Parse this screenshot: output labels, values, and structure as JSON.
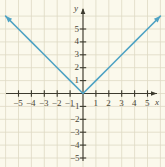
{
  "figure": {
    "name": "absolute-value-function-graph",
    "background_color": "#fbf9ec",
    "grid_color": "#ded9c4",
    "axis_color": "#3c3a2e",
    "curve_color": "#4fa3c4",
    "label_color": "#4a4636"
  },
  "axes": {
    "x_label": "x",
    "y_label": "y",
    "x_ticks": [
      {
        "value": -5,
        "label": "−5"
      },
      {
        "value": -4,
        "label": "−4"
      },
      {
        "value": -3,
        "label": "−3"
      },
      {
        "value": -2,
        "label": "−2"
      },
      {
        "value": -1,
        "label": "−1"
      },
      {
        "value": 1,
        "label": "1"
      },
      {
        "value": 2,
        "label": "2"
      },
      {
        "value": 3,
        "label": "3"
      },
      {
        "value": 4,
        "label": "4"
      },
      {
        "value": 5,
        "label": "5"
      }
    ],
    "y_ticks": [
      {
        "value": 5,
        "label": "5"
      },
      {
        "value": 4,
        "label": "4"
      },
      {
        "value": 3,
        "label": "3"
      },
      {
        "value": 2,
        "label": "2"
      },
      {
        "value": 1,
        "label": "1"
      },
      {
        "value": -1,
        "label": "−1"
      },
      {
        "value": -2,
        "label": "−2"
      },
      {
        "value": -3,
        "label": "−3"
      },
      {
        "value": -4,
        "label": "−4"
      },
      {
        "value": -5,
        "label": "−5"
      }
    ]
  },
  "chart_data": {
    "type": "line",
    "title": "",
    "subtitle": "",
    "xlabel": "x",
    "ylabel": "y",
    "xlim": [
      -6.4,
      6.3
    ],
    "ylim": [
      -5.7,
      6.4
    ],
    "grid": true,
    "legend": "none",
    "equation": "y = |x|",
    "annotations": [],
    "series": [
      {
        "name": "y = |x|",
        "color": "#4fa3c4",
        "arrow_start": true,
        "arrow_end": true,
        "x": [
          -6.0,
          -5,
          -4,
          -3,
          -2,
          -1,
          0,
          1,
          2,
          3,
          4,
          5,
          6.0
        ],
        "values": [
          6.0,
          5,
          4,
          3,
          2,
          1,
          0,
          1,
          2,
          3,
          4,
          5,
          6.0
        ]
      }
    ],
    "vertex": {
      "x": 0,
      "y": 0
    }
  }
}
